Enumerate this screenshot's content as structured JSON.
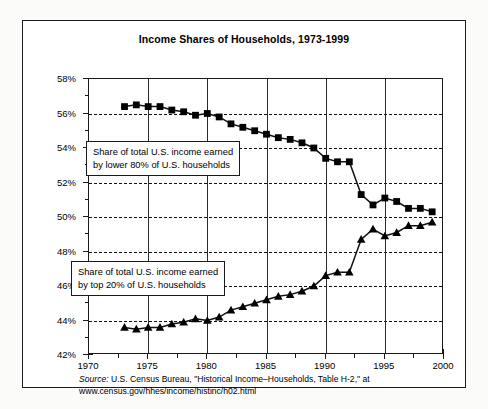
{
  "chart_data": {
    "type": "line",
    "title": "Income Shares of Households, 1973-1999",
    "xlabel": "",
    "ylabel": "",
    "xlim": [
      1970,
      2000
    ],
    "ylim": [
      42,
      58
    ],
    "grid": true,
    "legend_position": "inline-annotations",
    "x_ticks": [
      1970,
      1975,
      1980,
      1985,
      1990,
      1995,
      2000
    ],
    "x_tick_labels": [
      "1970",
      "1975",
      "1980",
      "1985",
      "1990",
      "1995",
      "2000"
    ],
    "x_minor_ticks": [
      1972.5,
      1977.5,
      1982.5,
      1987.5,
      1992.5,
      1997.5
    ],
    "y_ticks": [
      42,
      44,
      46,
      48,
      50,
      52,
      54,
      56,
      58
    ],
    "y_tick_labels": [
      "42%",
      "44%",
      "46%",
      "48%",
      "50%",
      "52%",
      "54%",
      "56%",
      "58%"
    ],
    "y_minor_ticks": [
      43,
      45,
      47,
      49,
      51,
      53,
      55,
      57
    ],
    "gridlines_y": [
      44,
      46,
      48,
      50,
      52,
      54,
      56
    ],
    "gridlines_x": [
      1975,
      1980,
      1985,
      1990,
      1995
    ],
    "x": [
      1973,
      1974,
      1975,
      1976,
      1977,
      1978,
      1979,
      1980,
      1981,
      1982,
      1983,
      1984,
      1985,
      1986,
      1987,
      1988,
      1989,
      1990,
      1991,
      1992,
      1993,
      1994,
      1995,
      1996,
      1997,
      1998,
      1999
    ],
    "series": [
      {
        "name": "Share of total U.S. income earned by lower 80% of U.S. households",
        "marker": "square",
        "values": [
          56.4,
          56.5,
          56.4,
          56.4,
          56.2,
          56.1,
          55.9,
          56.0,
          55.8,
          55.4,
          55.2,
          55.0,
          54.8,
          54.6,
          54.5,
          54.3,
          54.0,
          53.4,
          53.2,
          53.2,
          51.3,
          50.7,
          51.1,
          50.9,
          50.5,
          50.5,
          50.3
        ]
      },
      {
        "name": "Share of total U.S. income earned by top 20% of U.S. households",
        "marker": "triangle",
        "values": [
          43.6,
          43.5,
          43.6,
          43.6,
          43.8,
          43.9,
          44.1,
          44.0,
          44.2,
          44.6,
          44.8,
          45.0,
          45.2,
          45.4,
          45.5,
          45.7,
          46.0,
          46.6,
          46.8,
          46.8,
          48.7,
          49.3,
          48.9,
          49.1,
          49.5,
          49.5,
          49.7
        ]
      }
    ],
    "annotations": [
      {
        "id": "lower80",
        "line1": "Share of total U.S. income earned",
        "line2": "by lower 80% of U.S. households"
      },
      {
        "id": "top20",
        "line1": "Share of total U.S. income earned",
        "line2": "by top 20% of U.S. households"
      }
    ],
    "source": {
      "label": "Source:",
      "line1": " U.S. Census Bureau, \"Historical Income–Households, Table H-2,\" at",
      "line2": "www.census.gov/hhes/income/histinc/h02.html"
    },
    "colors": {
      "line": "#111111",
      "marker": "#000000",
      "grid": "#111111",
      "background": "#ffffff"
    }
  }
}
